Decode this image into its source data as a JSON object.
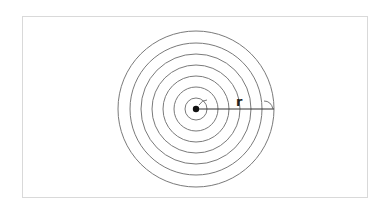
{
  "diagram": {
    "type": "concentric-circles",
    "center": {
      "x": 196,
      "y": 109
    },
    "radii": [
      11,
      22,
      33,
      44,
      55,
      66,
      78
    ],
    "radius_label": "r",
    "stroke_color": "#7a7a7a",
    "line_color": "#333333",
    "frame_color": "#d9d9d9"
  }
}
